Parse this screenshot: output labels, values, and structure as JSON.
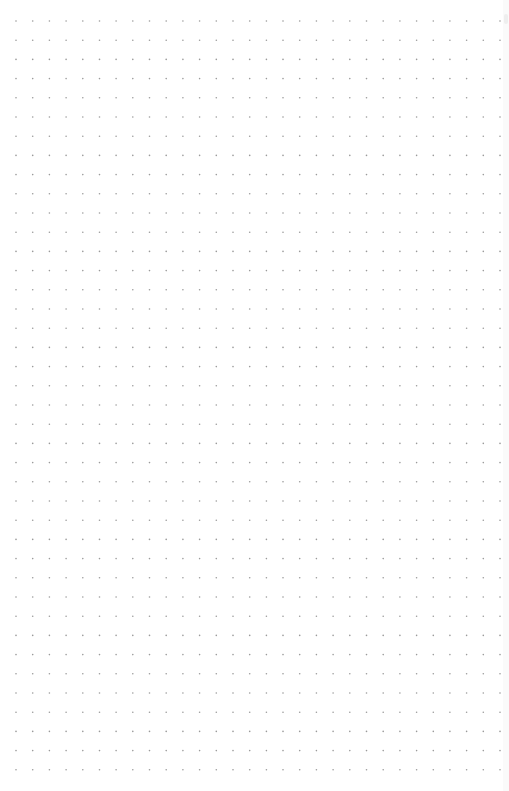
{
  "canvas": {
    "background": "#ffffff",
    "dot_color": "#9a9a9a",
    "dot_radius": 0.8,
    "columns": 30,
    "rows": 40,
    "origin_x": 16,
    "origin_y": 21,
    "spacing_x": 16.69,
    "spacing_y": 19.2
  }
}
